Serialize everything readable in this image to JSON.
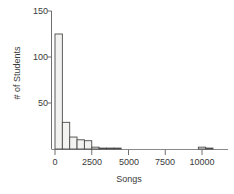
{
  "chart_data": {
    "type": "bar",
    "title": "",
    "subtitle": "",
    "xlabel": "Songs",
    "ylabel": "# of Students",
    "grid": false,
    "legend": false,
    "legend_position": "none",
    "xlim": [
      -250,
      10750
    ],
    "ylim": [
      0,
      150
    ],
    "xticks": [
      0,
      2500,
      5000,
      7500,
      10000
    ],
    "xtick_labels": [
      "0",
      "2500",
      "5000",
      "7500",
      "10000"
    ],
    "yticks": [
      50,
      100,
      150
    ],
    "ytick_labels": [
      "50",
      "100",
      "150"
    ],
    "bin_width": 500,
    "categories": [
      "0-500",
      "500-1000",
      "1000-1500",
      "1500-2000",
      "2000-2500",
      "2500-3000",
      "3000-3500",
      "3500-4000",
      "4000-4500",
      "9750-10250",
      "10250-10750"
    ],
    "bin_starts": [
      0,
      500,
      1000,
      1500,
      2000,
      2500,
      3000,
      3500,
      4000,
      9750,
      10250
    ],
    "values": [
      125,
      29,
      13,
      10,
      9,
      2,
      1,
      1,
      1,
      2,
      1
    ],
    "bar_fill": "#f2f2f0",
    "bar_stroke": "#4a4a4a",
    "axis_color": "#6f6f6f",
    "text_color": "#3a3a3a",
    "background": "#ffffff"
  },
  "figure": {
    "alt": "Histogram of number of songs per student"
  }
}
